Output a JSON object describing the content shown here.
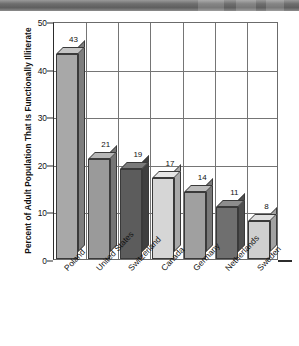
{
  "figure": {
    "y_axis_title": "Percent of Adult Population That Is Functionally Illiterate",
    "scan_band": "dark-scan-artifact-band"
  },
  "chart_data": {
    "type": "bar",
    "title": "",
    "subtitle": "",
    "xlabel": "",
    "ylabel": "Percent of Adult Population That Is Functionally Illiterate",
    "categories": [
      "Poland",
      "United States",
      "Switzerland",
      "Canada",
      "Germany",
      "Netherlands",
      "Sweden"
    ],
    "values": [
      43,
      21,
      19,
      17,
      14,
      11,
      8
    ],
    "value_labels": [
      "43",
      "21",
      "19",
      "17",
      "14",
      "11",
      "8"
    ],
    "ylim": [
      0,
      50
    ],
    "yticks": [
      0,
      10,
      20,
      30,
      40,
      50
    ],
    "ytick_labels": [
      "0",
      "10",
      "20",
      "30",
      "40",
      "50"
    ],
    "grid": true,
    "legend": "none",
    "style": "3d-bar",
    "bar_colors": [
      "#a8a8a8",
      "#9a9a9a",
      "#5c5c5c",
      "#d6d6d6",
      "#a0a0a0",
      "#6f6f6f",
      "#cfcfcf"
    ],
    "bar_top_colors": [
      "#c4c4c4",
      "#b6b6b6",
      "#7a7a7a",
      "#e6e6e6",
      "#bcbcbc",
      "#8d8d8d",
      "#e0e0e0"
    ],
    "bar_side_colors": [
      "#7e7e7e",
      "#757575",
      "#3f3f3f",
      "#a9a9a9",
      "#787878",
      "#4f4f4f",
      "#a2a2a2"
    ]
  }
}
